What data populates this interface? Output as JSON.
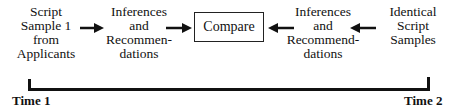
{
  "diagram": {
    "left_source": {
      "lines": [
        "Script",
        "Sample 1",
        "from",
        "Applicants"
      ]
    },
    "left_inference": {
      "lines": [
        "Inferences",
        "and",
        "Recommen-",
        "dations"
      ]
    },
    "center": {
      "label": "Compare"
    },
    "right_inference": {
      "lines": [
        "Inferences",
        "and",
        "Recommend-",
        "dations"
      ]
    },
    "right_source": {
      "lines": [
        "Identical",
        "Script",
        "Samples"
      ]
    },
    "arrows": [
      {
        "from": "left_source",
        "to": "left_inference",
        "direction": "right"
      },
      {
        "from": "left_inference",
        "to": "center",
        "direction": "right"
      },
      {
        "from": "right_inference",
        "to": "center",
        "direction": "left"
      },
      {
        "from": "right_source",
        "to": "right_inference",
        "direction": "left"
      }
    ],
    "timeline": {
      "start_label": "Time 1",
      "end_label": "Time 2"
    }
  }
}
